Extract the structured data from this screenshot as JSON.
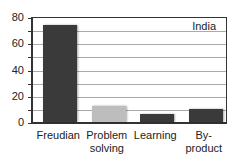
{
  "chart_data": {
    "type": "bar",
    "title": "",
    "xlabel": "",
    "ylabel": "",
    "ylim": [
      0,
      80
    ],
    "yticks": [
      0,
      20,
      40,
      60,
      80
    ],
    "grid": true,
    "gridline_step": 10,
    "legend": {
      "position": "top-right",
      "entries": [
        "India"
      ]
    },
    "categories": [
      "Freudian",
      "Problem solving",
      "Learning",
      "By-product"
    ],
    "category_labels_display": [
      [
        "Freudian"
      ],
      [
        "Problem",
        "solving"
      ],
      [
        "Learning"
      ],
      [
        "By-",
        "product"
      ]
    ],
    "series": [
      {
        "name": "India",
        "values": [
          74,
          12.5,
          6,
          10
        ]
      }
    ],
    "bar_colors": [
      "#3a3a3a",
      "#bdbdbd",
      "#3a3a3a",
      "#3a3a3a"
    ]
  }
}
